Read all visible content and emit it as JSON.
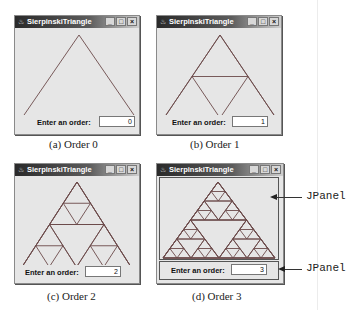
{
  "windows": [
    {
      "id": "a",
      "title": "SierpinskiTriangle",
      "order_label": "Enter an order:",
      "order_value": "0",
      "order": 0,
      "caption": "(a) Order 0",
      "box": {
        "x": 14,
        "y": 15,
        "w": 124,
        "h": 118
      },
      "tri": {
        "ax": 62,
        "ay": 6,
        "bx": 5,
        "by": 89,
        "cx": 119,
        "cy": 89
      }
    },
    {
      "id": "b",
      "title": "SierpinskiTriangle",
      "order_label": "Enter an order:",
      "order_value": "1",
      "order": 1,
      "caption": "(b) Order 1",
      "box": {
        "x": 156,
        "y": 15,
        "w": 124,
        "h": 118
      },
      "tri": {
        "ax": 61,
        "ay": 6,
        "bx": 5,
        "by": 89,
        "cx": 117,
        "cy": 89
      }
    },
    {
      "id": "c",
      "title": "SierpinskiTriangle",
      "order_label": "Enter an order:",
      "order_value": "2",
      "order": 2,
      "caption": "(c) Order 2",
      "box": {
        "x": 14,
        "y": 163,
        "w": 124,
        "h": 119
      },
      "tri": {
        "ax": 60,
        "ay": 5,
        "bx": 5,
        "by": 90,
        "cx": 114,
        "cy": 90
      }
    },
    {
      "id": "d",
      "title": "SierpinskiTriangle",
      "order_label": "Enter an order:",
      "order_value": "3",
      "order": 3,
      "caption": "(d) Order 3",
      "box": {
        "x": 156,
        "y": 163,
        "w": 126,
        "h": 119
      },
      "tri": {
        "ax": 59,
        "ay": 5,
        "bx": 4,
        "by": 81,
        "cx": 116,
        "cy": 81
      }
    }
  ],
  "window_controls": {
    "minimize": "_",
    "maximize": "□",
    "close": "×"
  },
  "title_icon": "java-cup-icon",
  "annotations": [
    {
      "label": "JPanel",
      "target": "drawing-panel"
    },
    {
      "label": "JPanel",
      "target": "input-panel"
    }
  ],
  "colors": {
    "triangle_stroke": "#6b4a4a",
    "window_bg": "#e6e6e6",
    "title_dark": "#2a2a2a"
  }
}
